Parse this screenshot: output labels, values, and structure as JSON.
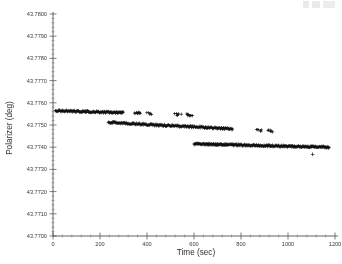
{
  "figure": {
    "background_color": "#ffffff",
    "ink_color": "#101010",
    "axis_color": "#3c3c3c"
  },
  "chart_data": {
    "type": "scatter",
    "title": "",
    "subtitle": "",
    "xlabel": "Time (sec)",
    "ylabel": "Polarizer (deg)",
    "xlim": [
      0,
      1200
    ],
    "ylim": [
      43.77,
      43.78
    ],
    "xticks": [
      0,
      200,
      400,
      600,
      800,
      1000,
      1200
    ],
    "xtick_labels": [
      "0",
      "200",
      "400",
      "600",
      "800",
      "1000",
      "1200"
    ],
    "yticks": [
      43.77,
      43.771,
      43.772,
      43.773,
      43.774,
      43.775,
      43.776,
      43.777,
      43.778,
      43.779,
      43.78
    ],
    "ytick_labels": [
      "43.7700",
      "43.7710",
      "43.7720",
      "43.7730",
      "43.7740",
      "43.7750",
      "43.7760",
      "43.7770",
      "43.7780",
      "43.7790",
      "43.7800"
    ],
    "x_minor_ticks_per_major": 4,
    "y_minor_ticks_per_major": 4,
    "grid": false,
    "legend": null,
    "marker": "+",
    "marker_color": "#101010",
    "marker_size": 1.6,
    "series": [
      {
        "name": "branch-1",
        "x_start": 10,
        "x_end": 610,
        "y_at_x_start": 43.77565,
        "y_at_x_end": 43.77545,
        "dense_to_x": 300,
        "sparse_from_x": 300,
        "n_points": 300
      },
      {
        "name": "branch-2",
        "x_start": 235,
        "x_end": 1020,
        "y_at_x_start": 43.77512,
        "y_at_x_end": 43.77468,
        "dense_to_x": 760,
        "sparse_from_x": 760,
        "n_points": 360
      },
      {
        "name": "branch-3",
        "x_start": 600,
        "x_end": 1175,
        "y_at_x_start": 43.77415,
        "y_at_x_end": 43.774,
        "dense_to_x": 1175,
        "sparse_from_x": 1175,
        "n_points": 320
      }
    ],
    "outliers": [
      {
        "x": 1105,
        "y": 43.77368
      }
    ]
  }
}
